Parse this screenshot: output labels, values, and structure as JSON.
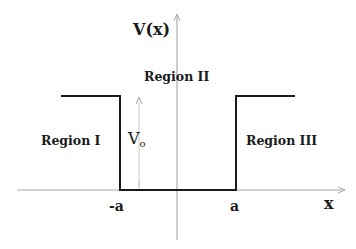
{
  "diagram": {
    "type": "finite-potential-well",
    "axes": {
      "y_label": "V(x)",
      "x_label": "x"
    },
    "ticks": {
      "left": "-a",
      "right": "a"
    },
    "regions": [
      {
        "label": "Region I"
      },
      {
        "label": "Region II"
      },
      {
        "label": "Region III"
      }
    ],
    "depth_label": {
      "main": "V",
      "sub": "o"
    },
    "colors": {
      "potential_line": "#1a1a1a",
      "axis": "#a8a8a8",
      "depth_arrow": "#c8c8c8",
      "text": "#1a1a1a",
      "background": "#ffffff"
    }
  }
}
